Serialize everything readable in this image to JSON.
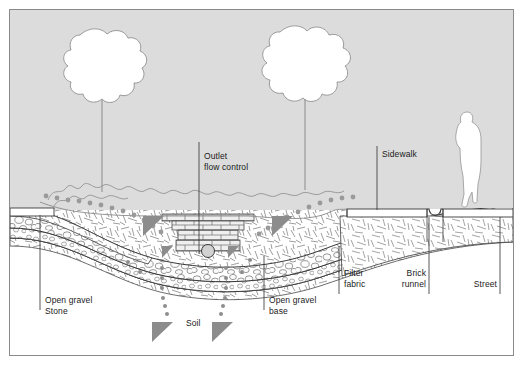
{
  "figure": {
    "background_color": "#dcdcdc",
    "border_color": "#8a8a8a",
    "line_color": "#3a3a3a",
    "dot_color": "#9a9a9a",
    "arrow_color": "#8c8c8c"
  },
  "labels": {
    "outlet_flow_control": "Outlet\nflow control",
    "sidewalk": "Sidewalk",
    "open_gravel_stone": "Open gravel\nStone",
    "soil": "Soil",
    "open_gravel_base": "Open gravel\nbase",
    "filter_fabric": "Filter\nfabric",
    "brick_runnel": "Brick\nrunnel",
    "street": "Street"
  },
  "elements": {
    "tree_left": "tree-left",
    "tree_right": "tree-right",
    "person": "person-figure",
    "vegetation": "vegetation-band",
    "outlet_structure": "brick-outlet-structure",
    "outlet_pipe": "outlet-pipe",
    "brick_runnel_channel": "brick-runnel-channel",
    "infiltration_arrows": "downward-infiltration-arrows",
    "flow_dots": "stormwater-flow-dots"
  }
}
